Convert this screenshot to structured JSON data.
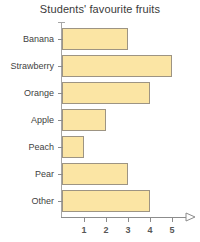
{
  "chart_data": {
    "type": "bar",
    "orientation": "horizontal",
    "title": "Students' favourite fruits",
    "xlabel": "",
    "ylabel": "",
    "categories": [
      "Banana",
      "Strawberry",
      "Orange",
      "Apple",
      "Peach",
      "Pear",
      "Other"
    ],
    "values": [
      3,
      5,
      4,
      2,
      1,
      3,
      4
    ],
    "xticks": [
      1,
      2,
      3,
      4,
      5
    ],
    "xtick_labels": [
      "1",
      "2",
      "3",
      "4",
      "5"
    ],
    "xlim": [
      0,
      5
    ],
    "grid": false,
    "legend": false,
    "bar_fill_color": "#fbe5a4",
    "bar_border_color": "#9d9483",
    "axis_color": "#8c8c8c",
    "title_color": "#3a3a3a",
    "label_color": "#3f3f3f",
    "tick_label_color": "#575757",
    "background_color": "#ffffff",
    "x_axis_arrow": true
  }
}
